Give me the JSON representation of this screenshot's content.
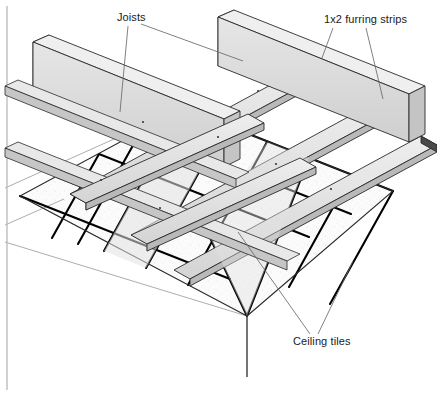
{
  "figure": {
    "type": "technical-illustration",
    "width": 437,
    "height": 396,
    "background_color": "#ffffff",
    "line_color": "#1a1a1a",
    "wood_fill_color": "#d6d6d6",
    "wood_light_color": "#ececec",
    "tile_fill_color": "#fbfbfb",
    "grid_line_color": "#000000",
    "leader_line_color": "#5a5a5a"
  },
  "labels": {
    "joists": "Joists",
    "furring_strips": "1x2 furring strips",
    "ceiling_tiles": "Ceiling tiles"
  },
  "leaders": {
    "joists": [
      {
        "from": [
          128,
          26
        ],
        "to": [
          120,
          112
        ]
      },
      {
        "from": [
          141,
          24
        ],
        "to": [
          243,
          61
        ]
      }
    ],
    "furring_strips": [
      {
        "from": [
          333,
          28
        ],
        "to": [
          322,
          58
        ]
      },
      {
        "from": [
          366,
          28
        ],
        "to": [
          383,
          99
        ]
      }
    ],
    "ceiling_tiles": [
      {
        "from": [
          310,
          334
        ],
        "to": [
          238,
          232
        ]
      },
      {
        "from": [
          318,
          334
        ],
        "to": [
          353,
          261
        ]
      }
    ]
  },
  "frame": {
    "left_border_x": 7,
    "left_border_top": 6,
    "left_border_bottom": 390
  },
  "wall": {
    "corner_x": 247,
    "corner_top_y": 316,
    "corner_bottom_y": 377
  },
  "chart_data": {
    "type": "diagram",
    "annotations": [
      {
        "label": "Joists",
        "count": 2,
        "description": "Structural wood joists running down-right in the isometric view"
      },
      {
        "label": "1x2 furring strips",
        "count": 2,
        "description": "Furring strips running down-left, attached under the joists"
      },
      {
        "label": "Ceiling tiles",
        "count": 2,
        "description": "Grid of acoustic ceiling tiles suspended below the framing"
      }
    ],
    "joist_count": 4,
    "furring_strip_count": 4,
    "tile_grid_columns": 5,
    "tile_grid_rows": 5
  }
}
